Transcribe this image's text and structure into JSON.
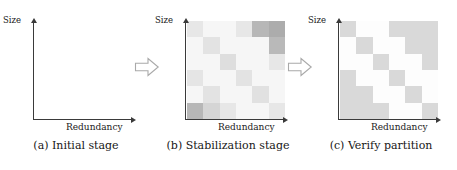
{
  "figure": {
    "axis_labels": {
      "y": "Size",
      "x": "Redundancy"
    },
    "arrow_icon_name": "right-arrow-icon",
    "colors": {
      "axis": "#3a3a3a",
      "text": "#161616",
      "arrow_outline": "#a9a9a9",
      "heatmap_light": "#fbfbfb",
      "heatmap_dark": "#8d8d8d",
      "partition_block": "#d9d9d9",
      "partition_background": "#fdfdfd"
    }
  },
  "panels": [
    {
      "id": "a",
      "caption": "(a) Initial stage",
      "y_label": "Size",
      "x_label": "Redundancy",
      "content": "empty-axes"
    },
    {
      "id": "b",
      "caption": "(b) Stabilization stage",
      "y_label": "Size",
      "x_label": "Redundancy",
      "content": "heatmap"
    },
    {
      "id": "c",
      "caption": "(c) Verify partition",
      "y_label": "Size",
      "x_label": "Redundancy",
      "content": "partition-staircase"
    }
  ],
  "chart_data": [
    {
      "type": "heatmap",
      "panel": "b",
      "title": "(b) Stabilization stage",
      "xlabel": "Redundancy",
      "ylabel": "Size",
      "rows": 6,
      "cols": 6,
      "grid": false,
      "legend": "none",
      "value_range": [
        0,
        1
      ],
      "colormap": "grayscale-inverted",
      "note": "values are normalized intensity, 0 = lightest, 1 = darkest; rows listed top (high Size) to bottom (low Size)",
      "values": [
        [
          0.18,
          0.05,
          0.05,
          0.18,
          0.62,
          0.72
        ],
        [
          0.05,
          0.22,
          0.05,
          0.05,
          0.05,
          0.6
        ],
        [
          0.05,
          0.05,
          0.26,
          0.05,
          0.05,
          0.18
        ],
        [
          0.2,
          0.05,
          0.05,
          0.22,
          0.05,
          0.05
        ],
        [
          0.05,
          0.22,
          0.05,
          0.05,
          0.24,
          0.05
        ],
        [
          0.55,
          0.05,
          0.05,
          0.05,
          0.05,
          0.18
        ],
        [
          0.68,
          0.42,
          0.2,
          0.05,
          0.05,
          0.05
        ]
      ],
      "values_6x6": [
        [
          0.18,
          0.05,
          0.05,
          0.18,
          0.62,
          0.72
        ],
        [
          0.05,
          0.22,
          0.05,
          0.05,
          0.05,
          0.6
        ],
        [
          0.05,
          0.05,
          0.26,
          0.05,
          0.05,
          0.18
        ],
        [
          0.2,
          0.05,
          0.05,
          0.22,
          0.05,
          0.05
        ],
        [
          0.05,
          0.22,
          0.05,
          0.05,
          0.24,
          0.05
        ],
        [
          0.62,
          0.35,
          0.18,
          0.05,
          0.05,
          0.18
        ]
      ]
    },
    {
      "type": "heatmap",
      "panel": "c",
      "title": "(c) Verify partition",
      "xlabel": "Redundancy",
      "ylabel": "Size",
      "rows": 6,
      "cols": 6,
      "grid": false,
      "legend": "none",
      "value_range": [
        0,
        1
      ],
      "colormap": "binary-block",
      "note": "1 = shaded partition block, 0 = background; descending staircase from top-left to bottom-right plus upper-right plateau; rows listed top to bottom",
      "values": [
        [
          1,
          0,
          0,
          1,
          1,
          1
        ],
        [
          0,
          1,
          0,
          0,
          1,
          1
        ],
        [
          0,
          0,
          1,
          0,
          0,
          1
        ],
        [
          1,
          0,
          0,
          1,
          0,
          0
        ],
        [
          1,
          1,
          0,
          0,
          1,
          0
        ],
        [
          1,
          1,
          1,
          0,
          0,
          1
        ]
      ]
    }
  ]
}
